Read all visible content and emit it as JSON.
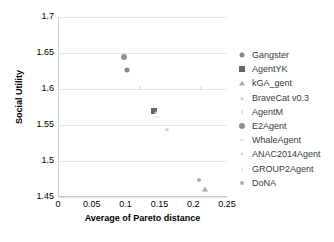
{
  "chart_data": {
    "type": "scatter",
    "title": "",
    "xlabel": "Average of Pareto distance",
    "ylabel": "Social Utility",
    "xlim": [
      0,
      0.25
    ],
    "ylim": [
      1.45,
      1.7
    ],
    "xticks": [
      "0",
      "0.05",
      "0.1",
      "0.15",
      "0.2",
      "0.25"
    ],
    "xtick_values": [
      0,
      0.05,
      0.1,
      0.15,
      0.2,
      0.25
    ],
    "yticks": [
      "1.45",
      "1.5",
      "1.55",
      "1.6",
      "1.65",
      "1.7"
    ],
    "ytick_values": [
      1.45,
      1.5,
      1.55,
      1.6,
      1.65,
      1.7
    ],
    "grid": "horizontal",
    "legend_position": "right",
    "series": [
      {
        "name": "Gangster",
        "marker": "circle",
        "color": "#888888",
        "size": 5,
        "points": [
          {
            "x": 0.101,
            "y": 1.626
          }
        ]
      },
      {
        "name": "AgentYK",
        "marker": "square",
        "color": "#666666",
        "size": 6,
        "points": [
          {
            "x": 0.141,
            "y": 1.57
          }
        ]
      },
      {
        "name": "kGA_gent",
        "marker": "triangle",
        "color": "#aaaaaa",
        "size": 5,
        "points": [
          {
            "x": 0.216,
            "y": 1.461
          }
        ]
      },
      {
        "name": "BraveCat v0.3",
        "marker": "cross",
        "color": "#a8a8a8",
        "size": 6,
        "points": [
          {
            "x": 0.16,
            "y": 1.544
          }
        ]
      },
      {
        "name": "AgentM",
        "marker": "tick",
        "color": "#cccccc",
        "size": 4,
        "points": [
          {
            "x": 0.12,
            "y": 1.601
          }
        ]
      },
      {
        "name": "E2Agent",
        "marker": "circle",
        "color": "#909090",
        "size": 6,
        "points": [
          {
            "x": 0.096,
            "y": 1.645
          }
        ]
      },
      {
        "name": "WhaleAgent",
        "marker": "dash",
        "color": "#d0d0d0",
        "size": 4,
        "points": [
          {
            "x": 0.145,
            "y": 1.561
          }
        ]
      },
      {
        "name": "ANAC2014Agent",
        "marker": "dot",
        "color": "#d8d8d8",
        "size": 3,
        "points": [
          {
            "x": 0.144,
            "y": 1.566
          }
        ]
      },
      {
        "name": "GROUP2Agent",
        "marker": "tick",
        "color": "#d8d8d8",
        "size": 4,
        "points": [
          {
            "x": 0.21,
            "y": 1.601
          }
        ]
      },
      {
        "name": "DoNA",
        "marker": "circle",
        "color": "#b0b0b0",
        "size": 4,
        "points": [
          {
            "x": 0.207,
            "y": 1.473
          }
        ]
      }
    ]
  },
  "legend": {
    "items": [
      {
        "label": "Gangster"
      },
      {
        "label": "AgentYK"
      },
      {
        "label": "kGA_gent"
      },
      {
        "label": "BraveCat v0.3"
      },
      {
        "label": "AgentM"
      },
      {
        "label": "E2Agent"
      },
      {
        "label": "WhaleAgent"
      },
      {
        "label": "ANAC2014Agent"
      },
      {
        "label": "GROUP2Agent"
      },
      {
        "label": "DoNA"
      }
    ]
  }
}
